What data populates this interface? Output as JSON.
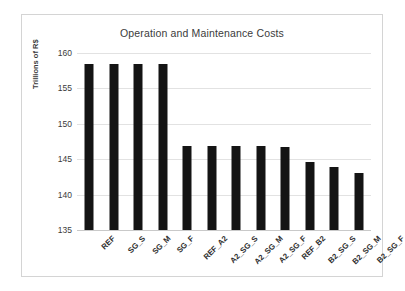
{
  "chart_data": {
    "type": "bar",
    "title": "Operation and Maintenance Costs",
    "xlabel": "",
    "ylabel": "Trillions of R$",
    "ylim": [
      135,
      160
    ],
    "yticks": [
      135,
      140,
      145,
      150,
      155,
      160
    ],
    "grid": true,
    "legend": false,
    "bar_color": "#141414",
    "categories": [
      "REF",
      "SG_S",
      "SG_M",
      "SG_F",
      "REF_A2",
      "A2_SG_S",
      "A2_SG_M",
      "A2_SG_F",
      "REF_B2",
      "B2_SG_S",
      "B2_SG_M",
      "B2_SG_F"
    ],
    "values": [
      158.5,
      158.5,
      158.5,
      158.5,
      146.8,
      146.8,
      146.8,
      146.8,
      146.7,
      144.6,
      143.9,
      143.0
    ]
  }
}
